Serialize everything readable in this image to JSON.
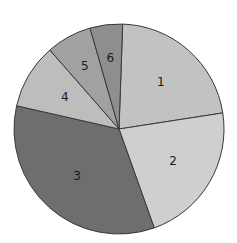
{
  "chart_data": {
    "type": "pie",
    "title": "",
    "categories": [
      "1",
      "2",
      "3",
      "4",
      "5",
      "6"
    ],
    "values": [
      22,
      22,
      34,
      10,
      7,
      5
    ],
    "unit": "percent (estimated)",
    "start_angle_deg": 2,
    "direction": "clockwise",
    "colors": [
      "#c2c2c2",
      "#cfcfcf",
      "#6e6e6e",
      "#bdbdbd",
      "#a1a1a1",
      "#8e8e8e"
    ],
    "labels_inside": true,
    "legend": "none"
  },
  "geometry": {
    "cx": 119,
    "cy": 129,
    "r": 105
  }
}
